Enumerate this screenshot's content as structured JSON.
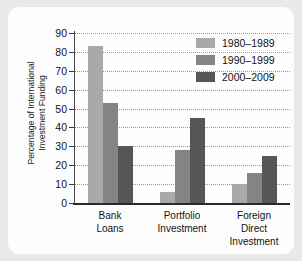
{
  "chart_data": {
    "type": "bar",
    "title": "",
    "xlabel": "",
    "ylabel": "Percentage of International Investment Funding",
    "ylabel_line1": "Percentage of International",
    "ylabel_line2": "Investment Funding",
    "categories": [
      "Bank Loans",
      "Portfolio Investment",
      "Foreign Direct Investment"
    ],
    "category_lines": [
      [
        "Bank",
        "Loans"
      ],
      [
        "Portfolio",
        "Investment"
      ],
      [
        "Foreign",
        "Direct",
        "Investment"
      ]
    ],
    "series": [
      {
        "name": "1980–1989",
        "color": "#a9a9a9",
        "values": [
          83,
          6,
          10
        ]
      },
      {
        "name": "1990–1999",
        "color": "#848484",
        "values": [
          53,
          28,
          16
        ]
      },
      {
        "name": "2000–2009",
        "color": "#565656",
        "values": [
          30,
          45,
          25
        ]
      }
    ],
    "ylim": [
      0,
      90
    ],
    "yticks": [
      0,
      10,
      20,
      30,
      40,
      50,
      60,
      70,
      80,
      90
    ],
    "ytick_labels": [
      "0",
      "10",
      "20",
      "30",
      "40",
      "50",
      "60",
      "70",
      "80",
      "90"
    ],
    "grid": true,
    "grid_style": "dotted",
    "legend_position": "top-right",
    "background_color": "#fdfdfd",
    "page_background_color": "#e9e9e9"
  }
}
